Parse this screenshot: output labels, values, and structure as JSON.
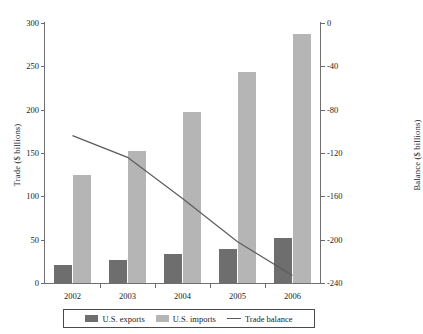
{
  "chart_data": {
    "type": "bar",
    "title": "",
    "subtitle": "",
    "xlabel": "",
    "ylabel": "Trade ($ billions)",
    "y2label": "Balance ($ billions)",
    "categories": [
      "2002",
      "2003",
      "2004",
      "2005",
      "2006"
    ],
    "series": [
      {
        "name": "U.S. exports",
        "axis": "left",
        "type": "bar",
        "color": "#6e6e6e",
        "values": [
          21,
          27,
          33,
          39,
          52
        ]
      },
      {
        "name": "U.S. imports",
        "axis": "left",
        "type": "bar",
        "color": "#b5b5b5",
        "values": [
          125,
          152,
          197,
          243,
          287
        ]
      },
      {
        "name": "Trade balance",
        "axis": "right",
        "type": "line",
        "color": "#5b5b5b",
        "values": [
          -104,
          -124,
          -162,
          -202,
          -233
        ]
      }
    ],
    "ylim": [
      0,
      300
    ],
    "yticks": [
      "0",
      "50",
      "100",
      "150",
      "200",
      "250",
      "300"
    ],
    "y2lim": [
      -240,
      0
    ],
    "y2ticks": [
      "0",
      "-40",
      "-80",
      "-120",
      "-160",
      "-200",
      "-240"
    ],
    "grid": false,
    "legend_position": "bottom"
  },
  "legend": {
    "items": [
      {
        "label": "U.S. exports",
        "marker": "swatch-dark"
      },
      {
        "label": "U.S. imports",
        "marker": "swatch-light"
      },
      {
        "label": "Trade balance",
        "marker": "line"
      }
    ]
  }
}
